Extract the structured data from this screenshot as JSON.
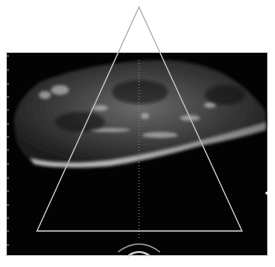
{
  "image": {
    "type": "ultrasound-scan",
    "description": "Grayscale ultrasound image with triangular region-of-interest overlay",
    "colors": {
      "background": "#ffffff",
      "scan_field": "#030303",
      "overlay_line": "#b8b8b8"
    }
  }
}
